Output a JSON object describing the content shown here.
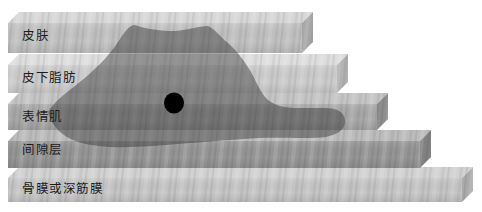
{
  "diagram": {
    "layers": [
      {
        "label": "皮肤",
        "front": "#c2c2c2",
        "top": "#d7d7d7",
        "side": "#a6a6a6"
      },
      {
        "label": "皮下脂肪",
        "front": "#cdcdcd",
        "top": "#dedede",
        "side": "#b2b2b2"
      },
      {
        "label": "表情肌",
        "front": "#a9a9a9",
        "top": "#c5c5c5",
        "side": "#8e8e8e"
      },
      {
        "label": "间隙层",
        "front": "#969696",
        "top": "#bcbcbc",
        "side": "#828282"
      },
      {
        "label": "骨膜或深筋膜",
        "front": "#c6c6c6",
        "top": "#d2d2d2",
        "side": "#ababab"
      }
    ],
    "label_color": "#1b1b1b",
    "highlight_region_color": "rgba(40,40,40,0.42)",
    "marker_color": "#000000"
  }
}
